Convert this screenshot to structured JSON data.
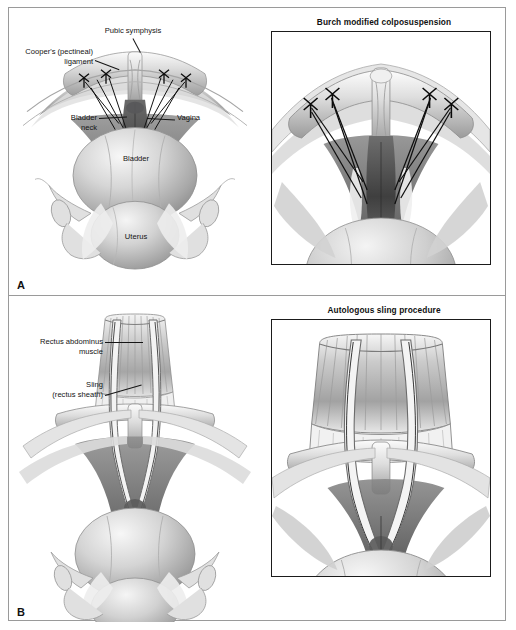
{
  "figure": {
    "panels": [
      {
        "letter": "A",
        "procedure_title": "Burch modified colposuspension",
        "labels": [
          {
            "id": "pubic-symphysis",
            "text": "Pubic symphysis"
          },
          {
            "id": "coopers-ligament",
            "text": "Cooper's (pectineal)\nligament"
          },
          {
            "id": "bladder-neck",
            "text": "Bladder\nneck"
          },
          {
            "id": "vagina",
            "text": "Vagina"
          },
          {
            "id": "bladder",
            "text": "Bladder"
          },
          {
            "id": "uterus",
            "text": "Uterus"
          }
        ]
      },
      {
        "letter": "B",
        "procedure_title": "Autologous sling procedure",
        "labels": [
          {
            "id": "rectus-abdominus-muscle",
            "text": "Rectus abdominus\nmuscle"
          },
          {
            "id": "sling-rectus-sheath",
            "text": "Sling\n(rectus sheath)"
          }
        ]
      }
    ]
  },
  "colors": {
    "frame_border": "#9a9a9a",
    "box_border": "#1b1b1b",
    "label_text": "#141414",
    "leader_line": "#151515",
    "suture_line": "#101010",
    "tissue_light": "#e9e9e9",
    "tissue_mid": "#b8b8b8",
    "tissue_dark": "#6f6f6f",
    "background": "#ffffff"
  }
}
